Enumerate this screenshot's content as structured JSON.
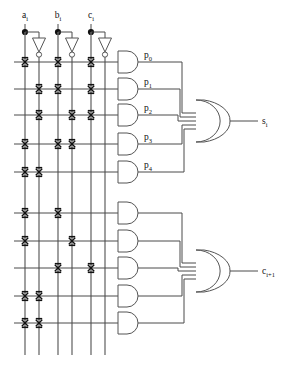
{
  "diagram": {
    "inputs": [
      {
        "id": "a",
        "label": "a",
        "sub": "i",
        "x": 25
      },
      {
        "id": "b",
        "label": "b",
        "sub": "i",
        "x": 58
      },
      {
        "id": "c",
        "label": "c",
        "sub": "i",
        "x": 91
      }
    ],
    "product_labels": [
      {
        "id": "p0",
        "label": "p",
        "sub": "0"
      },
      {
        "id": "p1",
        "label": "p",
        "sub": "1"
      },
      {
        "id": "p2",
        "label": "p",
        "sub": "2"
      },
      {
        "id": "p3",
        "label": "p",
        "sub": "3"
      },
      {
        "id": "p4",
        "label": "p",
        "sub": "4"
      }
    ],
    "outputs": [
      {
        "id": "sum",
        "label": "s",
        "sub": "i"
      },
      {
        "id": "carry",
        "label": "c",
        "sub": "i+1"
      }
    ],
    "column_x": [
      25,
      39,
      58,
      72,
      91,
      105
    ],
    "top_rows_y": [
      62,
      89,
      115,
      144,
      172
    ],
    "bottom_rows_y": [
      213,
      241,
      268,
      296,
      323
    ],
    "top_connections": [
      [
        0,
        2,
        4
      ],
      [
        1,
        2,
        4
      ],
      [
        1,
        3,
        4
      ],
      [
        0,
        2,
        3
      ],
      [
        0,
        1
      ]
    ],
    "bottom_connections": [
      [
        0,
        2
      ],
      [
        0,
        3
      ],
      [
        2,
        4
      ],
      [
        0,
        1
      ],
      [
        0,
        1
      ]
    ],
    "colors": {
      "wire": "#4a4a4a",
      "vertical_wire": "#6b6b6b",
      "gate_outline": "#555555",
      "mark": "#111111",
      "background": "#ffffff"
    }
  }
}
